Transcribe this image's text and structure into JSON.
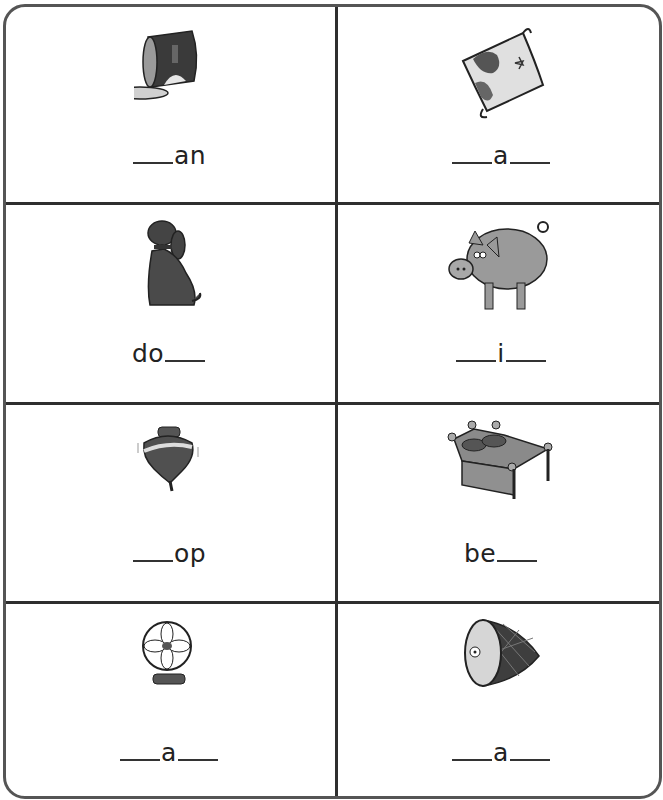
{
  "worksheet": {
    "cells": [
      {
        "picture": "can",
        "word": "___an",
        "parts": [
          "",
          "an"
        ],
        "blank_before": true,
        "blank_after": false
      },
      {
        "picture": "map",
        "word": "___a___",
        "parts": [
          "",
          "a"
        ],
        "blank_before": true,
        "blank_after": true
      },
      {
        "picture": "dog",
        "word": "do___",
        "parts": [
          "do",
          ""
        ],
        "blank_before": false,
        "blank_after": true
      },
      {
        "picture": "pig",
        "word": "___i___",
        "parts": [
          "",
          "i"
        ],
        "blank_before": true,
        "blank_after": true
      },
      {
        "picture": "top",
        "word": "___op",
        "parts": [
          "",
          "op"
        ],
        "blank_before": true,
        "blank_after": false
      },
      {
        "picture": "bed",
        "word": "be___",
        "parts": [
          "be",
          ""
        ],
        "blank_before": false,
        "blank_after": true
      },
      {
        "picture": "fan",
        "word": "___a___",
        "parts": [
          "",
          "a"
        ],
        "blank_before": true,
        "blank_after": true
      },
      {
        "picture": "ham",
        "word": "___a___",
        "parts": [
          "",
          "a"
        ],
        "blank_before": true,
        "blank_after": true
      }
    ],
    "colors": {
      "border": "#555555",
      "grid": "#2e2e2e",
      "ink": "#222222",
      "fill_dark": "#4a4a4a",
      "fill_mid": "#8a8a8a",
      "fill_light": "#d0d0d0"
    }
  }
}
